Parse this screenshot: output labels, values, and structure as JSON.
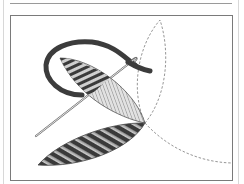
{
  "illustration": {
    "subject": "satin-stitch-leaf-embroidery",
    "elements": [
      "thread",
      "needle",
      "upper-leaf-stitched",
      "lower-leaf-stitched",
      "dashed-leaf-outline-upper",
      "dashed-leaf-outline-lower"
    ]
  },
  "colors": {
    "thread": "#3c3c3c",
    "stitch_dark": "#3a3a3a",
    "stitch_light": "#c8c8c8",
    "hatch_fill": "#d4d4d4",
    "outline_dashed": "#8a8a8a",
    "frame": "#7a7a7a",
    "needle": "#6e6e6e"
  }
}
